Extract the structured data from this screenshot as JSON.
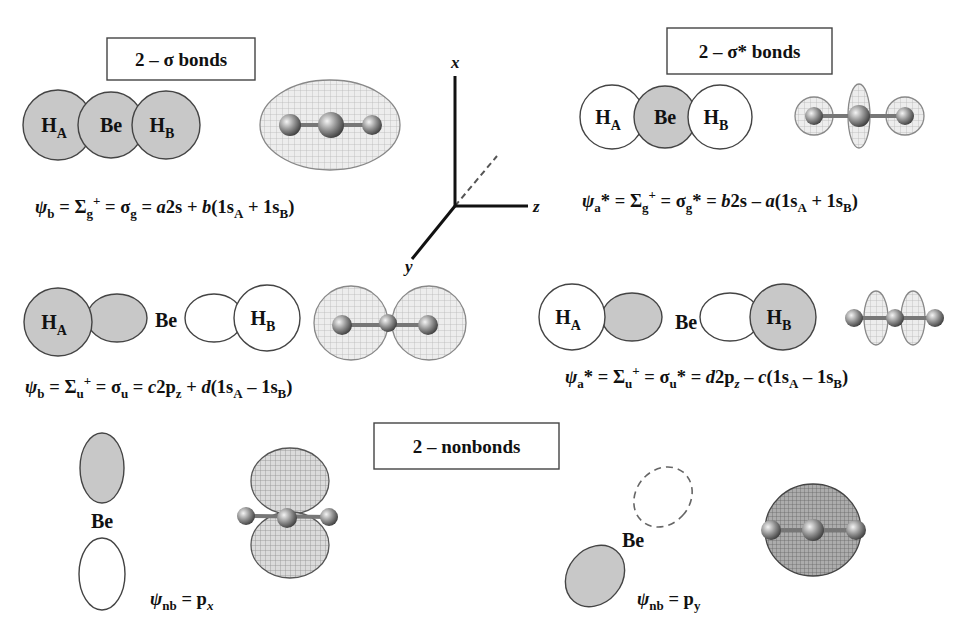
{
  "colors": {
    "orbital_fill_shaded": "#c8c8c8",
    "orbital_fill_empty": "#ffffff",
    "orbital_stroke": "#444444",
    "box_stroke": "#444444",
    "text": "#111111",
    "axis": "#111111"
  },
  "section_boxes": [
    {
      "id": "sigma-bonds",
      "label": "2 – σ bonds",
      "x": 107,
      "y": 38,
      "w": 148,
      "h": 42
    },
    {
      "id": "sigma-star-bonds",
      "label": "2 – σ* bonds",
      "x": 667,
      "y": 28,
      "w": 165,
      "h": 46
    },
    {
      "id": "nonbonds",
      "label": "2 – nonbonds",
      "x": 374,
      "y": 423,
      "w": 185,
      "h": 46
    }
  ],
  "axes": {
    "origin": [
      455,
      206
    ],
    "x_axis": {
      "label": "x",
      "end": [
        455,
        76
      ],
      "label_pos": [
        451,
        68
      ]
    },
    "z_axis": {
      "label": "z",
      "end": [
        528,
        206
      ],
      "label_pos": [
        533,
        212
      ]
    },
    "y_axis": {
      "label": "y",
      "end": [
        412,
        259
      ],
      "label_pos": [
        405,
        272
      ]
    },
    "hidden_axis": {
      "end": [
        497,
        156
      ],
      "dashed": true
    }
  },
  "orbitals": {
    "sigma_g": {
      "circles": [
        {
          "name": "H_A",
          "cx": 58,
          "cy": 125,
          "r": 35,
          "shaded": true,
          "label": "H",
          "sub": "A"
        },
        {
          "name": "Be",
          "cx": 111,
          "cy": 125,
          "r": 33,
          "shaded": true,
          "label": "Be",
          "sub": ""
        },
        {
          "name": "H_B",
          "cx": 166,
          "cy": 125,
          "r": 34,
          "shaded": true,
          "label": "H",
          "sub": "B"
        }
      ]
    },
    "sigma_g_star": {
      "circles": [
        {
          "name": "H_A",
          "cx": 612,
          "cy": 117,
          "r": 32,
          "shaded": false,
          "label": "H",
          "sub": "A"
        },
        {
          "name": "Be",
          "cx": 665,
          "cy": 117,
          "r": 31,
          "shaded": true,
          "label": "Be",
          "sub": ""
        },
        {
          "name": "H_B",
          "cx": 720,
          "cy": 117,
          "r": 32,
          "shaded": false,
          "label": "H",
          "sub": "B"
        }
      ]
    },
    "sigma_u": {
      "ellipses": [
        {
          "name": "Be-lobe-left",
          "cx": 117,
          "cy": 318,
          "rx": 30,
          "ry": 24,
          "shaded": true
        },
        {
          "name": "H_A",
          "cx": 58,
          "cy": 322,
          "rx": 34,
          "ry": 34,
          "shaded": true,
          "label": "H",
          "sub": "A"
        },
        {
          "name": "Be-lobe-right",
          "cx": 214,
          "cy": 318,
          "rx": 29,
          "ry": 24,
          "shaded": false
        },
        {
          "name": "H_B",
          "cx": 267,
          "cy": 318,
          "rx": 33,
          "ry": 33,
          "shaded": false,
          "label": "H",
          "sub": "B"
        }
      ],
      "be_label": {
        "text": "Be",
        "x": 166,
        "y": 327
      }
    },
    "sigma_u_star": {
      "ellipses": [
        {
          "name": "Be-lobe-left",
          "cx": 632,
          "cy": 317,
          "rx": 30,
          "ry": 24,
          "shaded": true
        },
        {
          "name": "H_A",
          "cx": 572,
          "cy": 317,
          "rx": 33,
          "ry": 33,
          "shaded": false,
          "label": "H",
          "sub": "A"
        },
        {
          "name": "Be-lobe-right",
          "cx": 730,
          "cy": 317,
          "rx": 30,
          "ry": 24,
          "shaded": false
        },
        {
          "name": "H_B",
          "cx": 783,
          "cy": 317,
          "rx": 33,
          "ry": 33,
          "shaded": true,
          "label": "H",
          "sub": "B"
        }
      ],
      "be_label": {
        "text": "Be",
        "x": 686,
        "y": 329
      }
    },
    "p_x": {
      "ellipses": [
        {
          "name": "px-lobe-top",
          "cx": 102,
          "cy": 468,
          "rx": 22,
          "ry": 35,
          "shaded": true
        },
        {
          "name": "px-lobe-bottom",
          "cx": 102,
          "cy": 574,
          "rx": 23,
          "ry": 36,
          "shaded": false
        }
      ],
      "be_label": {
        "text": "Be",
        "x": 102,
        "y": 528
      }
    },
    "p_y": {
      "ellipses": [
        {
          "name": "py-lobe-back",
          "cx": 663,
          "cy": 497,
          "rx": 27,
          "ry": 32,
          "rotate": 40,
          "shaded": false,
          "dashed": true
        },
        {
          "name": "py-lobe-front",
          "cx": 595,
          "cy": 576,
          "rx": 27,
          "ry": 33,
          "rotate": 40,
          "shaded": true
        }
      ],
      "be_label": {
        "text": "Be",
        "x": 633,
        "y": 547
      }
    }
  },
  "isosurfaces": [
    {
      "id": "sigma-g-surface",
      "lobes": [
        {
          "cx": 330,
          "cy": 125,
          "rx": 70,
          "ry": 45
        }
      ],
      "atoms": [
        [
          290,
          125,
          11
        ],
        [
          331,
          125,
          13
        ],
        [
          372,
          125,
          10
        ]
      ],
      "shade": "light"
    },
    {
      "id": "sigma-g-star-surface",
      "lobes": [
        {
          "cx": 814,
          "cy": 116,
          "rx": 19,
          "ry": 19
        },
        {
          "cx": 905,
          "cy": 116,
          "rx": 19,
          "ry": 19
        },
        {
          "cx": 859,
          "cy": 116,
          "rx": 11,
          "ry": 32
        }
      ],
      "atoms": [
        [
          814,
          116,
          9
        ],
        [
          859,
          116,
          11
        ],
        [
          905,
          116,
          9
        ]
      ],
      "shade": "light"
    },
    {
      "id": "sigma-u-surface",
      "lobes": [
        {
          "cx": 351,
          "cy": 323,
          "rx": 37,
          "ry": 37
        },
        {
          "cx": 429,
          "cy": 323,
          "rx": 37,
          "ry": 37
        }
      ],
      "atoms": [
        [
          342,
          325,
          10
        ],
        [
          388,
          323,
          9
        ],
        [
          428,
          325,
          10
        ]
      ],
      "shade": "light"
    },
    {
      "id": "sigma-u-star-surface",
      "lobes": [
        {
          "cx": 876,
          "cy": 318,
          "rx": 12,
          "ry": 27
        },
        {
          "cx": 913,
          "cy": 318,
          "rx": 12,
          "ry": 27
        }
      ],
      "atoms": [
        [
          854,
          318,
          9
        ],
        [
          895,
          318,
          9
        ],
        [
          935,
          318,
          9
        ]
      ],
      "shade": "light"
    },
    {
      "id": "px-surface",
      "lobes": [
        {
          "cx": 290,
          "cy": 481,
          "rx": 39,
          "ry": 33
        },
        {
          "cx": 290,
          "cy": 545,
          "rx": 39,
          "ry": 33
        }
      ],
      "atoms": [
        [
          246,
          516,
          9
        ],
        [
          287,
          518,
          10
        ],
        [
          329,
          517,
          9
        ]
      ],
      "shade": "medium"
    },
    {
      "id": "py-surface",
      "lobes": [
        {
          "cx": 813,
          "cy": 530,
          "rx": 48,
          "ry": 46
        }
      ],
      "atoms": [
        [
          771,
          530,
          10
        ],
        [
          813,
          530,
          11
        ],
        [
          856,
          530,
          10
        ]
      ],
      "shade": "dark"
    }
  ],
  "formulas": {
    "sigma_g": {
      "x": 35,
      "y": 213,
      "parts": [
        {
          "t": "ψ",
          "it": true
        },
        {
          "t": "b",
          "sub": true
        },
        {
          "t": " = Σ"
        },
        {
          "t": "g",
          "sub": true
        },
        {
          "t": "+",
          "sup": true
        },
        {
          "t": " = σ"
        },
        {
          "t": "g",
          "sub": true
        },
        {
          "t": " = "
        },
        {
          "t": "a",
          "it": true
        },
        {
          "t": "2s + "
        },
        {
          "t": "b",
          "it": true
        },
        {
          "t": "(1s"
        },
        {
          "t": "A",
          "sub": true
        },
        {
          "t": " + 1s"
        },
        {
          "t": "B",
          "sub": true
        },
        {
          "t": ")"
        }
      ]
    },
    "sigma_g_star": {
      "x": 582,
      "y": 207,
      "parts": [
        {
          "t": "ψ",
          "it": true
        },
        {
          "t": "a",
          "sub": true
        },
        {
          "t": "* = Σ"
        },
        {
          "t": "g",
          "sub": true
        },
        {
          "t": "+",
          "sup": true
        },
        {
          "t": " = σ"
        },
        {
          "t": "g",
          "sub": true
        },
        {
          "t": "* = "
        },
        {
          "t": "b",
          "it": true
        },
        {
          "t": "2s – "
        },
        {
          "t": "a",
          "it": true
        },
        {
          "t": "(1s"
        },
        {
          "t": "A",
          "sub": true
        },
        {
          "t": " + 1s"
        },
        {
          "t": "B",
          "sub": true
        },
        {
          "t": ")"
        }
      ]
    },
    "sigma_u": {
      "x": 25,
      "y": 393,
      "parts": [
        {
          "t": "ψ",
          "it": true
        },
        {
          "t": "b",
          "sub": true
        },
        {
          "t": " = Σ"
        },
        {
          "t": "u",
          "sub": true
        },
        {
          "t": "+",
          "sup": true
        },
        {
          "t": " = σ"
        },
        {
          "t": "u",
          "sub": true
        },
        {
          "t": " = "
        },
        {
          "t": "c",
          "it": true
        },
        {
          "t": "2p"
        },
        {
          "t": "z",
          "sub": true
        },
        {
          "t": " + "
        },
        {
          "t": "d",
          "it": true
        },
        {
          "t": "(1s"
        },
        {
          "t": "A",
          "sub": true
        },
        {
          "t": " – 1s"
        },
        {
          "t": "B",
          "sub": true
        },
        {
          "t": ")"
        }
      ]
    },
    "sigma_u_star": {
      "x": 565,
      "y": 383,
      "parts": [
        {
          "t": "ψ",
          "it": true
        },
        {
          "t": "a",
          "sub": true
        },
        {
          "t": "* = Σ"
        },
        {
          "t": "u",
          "sub": true
        },
        {
          "t": "+",
          "sup": true
        },
        {
          "t": " = σ"
        },
        {
          "t": "u",
          "sub": true
        },
        {
          "t": "* = "
        },
        {
          "t": "d",
          "it": true
        },
        {
          "t": "2p"
        },
        {
          "t": "z",
          "sub": true,
          "it": true
        },
        {
          "t": " – "
        },
        {
          "t": "c",
          "it": true
        },
        {
          "t": "(1s"
        },
        {
          "t": "A",
          "sub": true
        },
        {
          "t": " – 1s"
        },
        {
          "t": "B",
          "sub": true
        },
        {
          "t": ")"
        }
      ]
    },
    "p_x": {
      "x": 150,
      "y": 605,
      "parts": [
        {
          "t": "ψ",
          "it": true
        },
        {
          "t": "nb",
          "sub": true
        },
        {
          "t": " = p"
        },
        {
          "t": "x",
          "sub": true,
          "it": true
        }
      ]
    },
    "p_y": {
      "x": 637,
      "y": 605,
      "parts": [
        {
          "t": "ψ",
          "it": true
        },
        {
          "t": "nb",
          "sub": true
        },
        {
          "t": " = p"
        },
        {
          "t": "y",
          "sub": true
        }
      ]
    }
  }
}
